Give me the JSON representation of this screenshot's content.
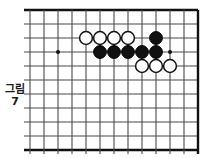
{
  "figure": {
    "caption_label": "그림\n7",
    "caption_line1": "그림",
    "caption_line2": "7",
    "type": "go-board-diagram"
  },
  "board": {
    "origin_x": 30,
    "origin_y": 10,
    "cell": 14,
    "cols": 12,
    "rows": 10,
    "line_color": "#4a4a4a",
    "border_color": "#111111",
    "background": "#ffffff",
    "edges_bold": [
      "top",
      "bottom",
      "right"
    ],
    "star_points": [
      {
        "col": 2,
        "row": 3
      },
      {
        "col": 10,
        "row": 3
      }
    ],
    "stone_radius": 6.4,
    "stones": [
      {
        "color": "white",
        "col": 4,
        "row": 2
      },
      {
        "color": "white",
        "col": 5,
        "row": 2
      },
      {
        "color": "white",
        "col": 6,
        "row": 2
      },
      {
        "color": "white",
        "col": 7,
        "row": 2
      },
      {
        "color": "black",
        "col": 9,
        "row": 2
      },
      {
        "color": "black",
        "col": 5,
        "row": 3
      },
      {
        "color": "black",
        "col": 6,
        "row": 3
      },
      {
        "color": "black",
        "col": 7,
        "row": 3
      },
      {
        "color": "black",
        "col": 8,
        "row": 3
      },
      {
        "color": "black",
        "col": 9,
        "row": 3
      },
      {
        "color": "white",
        "col": 8,
        "row": 4
      },
      {
        "color": "white",
        "col": 9,
        "row": 4
      },
      {
        "color": "white",
        "col": 10,
        "row": 4
      }
    ],
    "colors": {
      "black_stone": "#111111",
      "white_stone_fill": "#ffffff",
      "white_stone_stroke": "#111111"
    }
  }
}
